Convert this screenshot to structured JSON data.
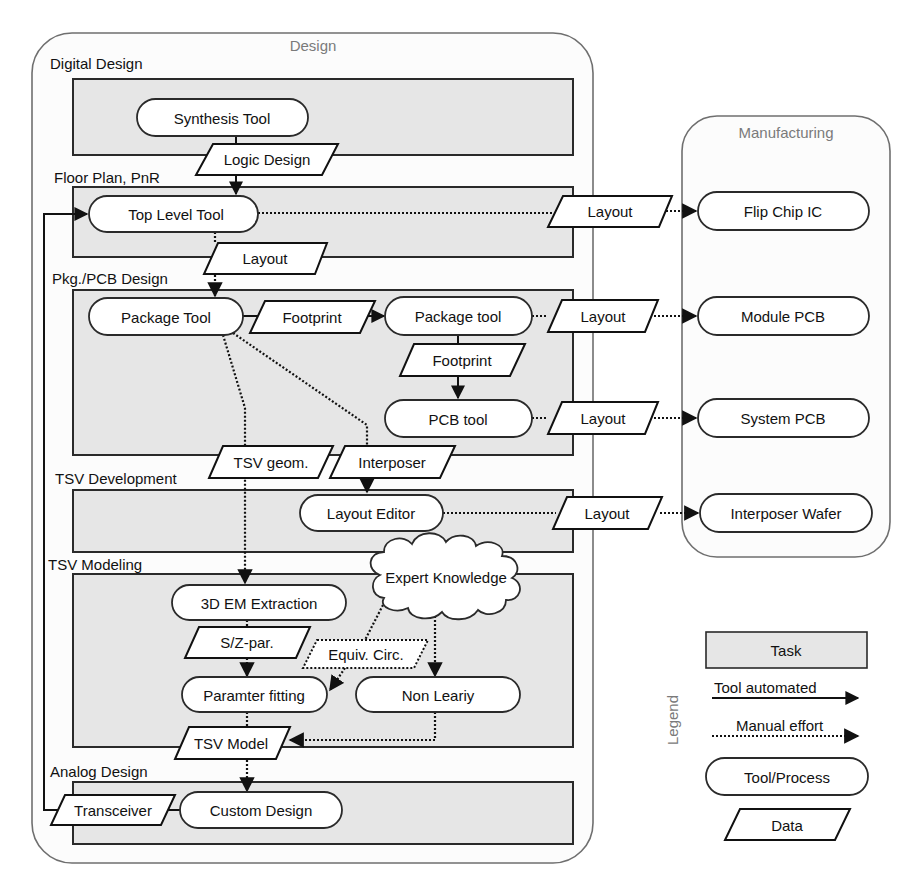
{
  "containers": {
    "design": "Design",
    "manufacturing": "Manufacturing",
    "legend": "Legend"
  },
  "tasks": {
    "digital_design": "Digital Design",
    "floor_plan": "Floor Plan, PnR",
    "pkg_pcb": "Pkg./PCB Design",
    "tsv_development": "TSV Development",
    "tsv_modeling": "TSV Modeling",
    "analog_design": "Analog Design"
  },
  "tools": {
    "synthesis": "Synthesis Tool",
    "top_level": "Top Level Tool",
    "package_tool_1": "Package Tool",
    "package_tool_2": "Package tool",
    "pcb_tool": "PCB tool",
    "layout_editor": "Layout Editor",
    "em_extraction": "3D EM Extraction",
    "parameter_fitting": "Paramter fitting",
    "non_linearity": "Non Leariy",
    "custom_design": "Custom Design",
    "flip_chip": "Flip Chip IC",
    "module_pcb": "Module PCB",
    "system_pcb": "System PCB",
    "interposer_wafer": "Interposer Wafer"
  },
  "data": {
    "logic_design": "Logic Design",
    "layout_toplevel": "Layout",
    "layout_internal": "Layout",
    "footprint_1": "Footprint",
    "footprint_2": "Footprint",
    "layout_module": "Layout",
    "layout_system": "Layout",
    "tsv_geom": "TSV geom.",
    "interposer": "Interposer",
    "layout_interposer": "Layout",
    "sz_par": "S/Z-par.",
    "equiv_circ": "Equiv. Circ.",
    "tsv_model": "TSV Model",
    "transceiver": "Transceiver"
  },
  "cloud": {
    "expert_knowledge": "Expert Knowledge"
  },
  "legend": {
    "task": "Task",
    "tool_automated": "Tool automated",
    "manual_effort": "Manual effort",
    "tool_process": "Tool/Process",
    "data": "Data"
  }
}
